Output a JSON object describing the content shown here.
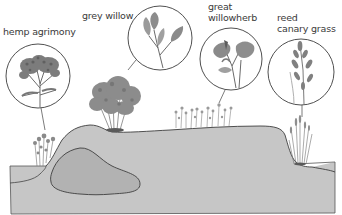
{
  "diagram": {
    "type": "illustrated cross-section",
    "colors": {
      "background": "#ffffff",
      "ground": "#c6c6c6",
      "ground_outline": "#4a4a4a",
      "inner_deposit": "#b2b2b2",
      "circle_outline": "#3c3c3c",
      "plant_ink": "#6a6a6a",
      "label_text": "#3a3a3a"
    },
    "labels": [
      {
        "id": "hemp-agrimony",
        "line1": "hemp agrimony",
        "line2": ""
      },
      {
        "id": "grey-willow",
        "line1": "grey willow",
        "line2": ""
      },
      {
        "id": "great-willowherb",
        "line1": "great",
        "line2": "willowherb"
      },
      {
        "id": "reed-canary-grass",
        "line1": "reed",
        "line2": "canary grass"
      }
    ],
    "callouts": [
      {
        "plant": "hemp agrimony",
        "icon": "hemp-agrimony-flower-icon"
      },
      {
        "plant": "grey willow",
        "icon": "grey-willow-leaf-icon"
      },
      {
        "plant": "great willowherb",
        "icon": "great-willowherb-flower-icon"
      },
      {
        "plant": "reed canary grass",
        "icon": "reed-canary-grass-icon"
      }
    ]
  }
}
